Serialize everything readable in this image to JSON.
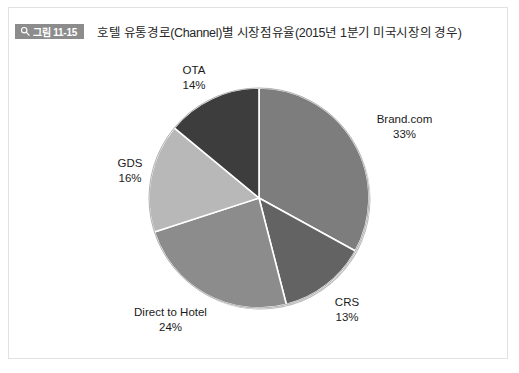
{
  "figure": {
    "badge_label": "그림 11-15",
    "badge_icon": "magnifier-icon",
    "badge_color": "#8c8c8c",
    "title": "호텔 유통경로(Channel)별 시장점유율(2015년 1분기 미국시장의 경우)",
    "panel_border_color": "#e2e2e2",
    "background_color": "#ffffff"
  },
  "chart_data": {
    "type": "pie",
    "title": "호텔 유통경로(Channel)별 시장점유율(2015년 1분기 미국시장의 경우)",
    "categories": [
      "Brand.com",
      "CRS",
      "Direct to Hotel",
      "GDS",
      "OTA"
    ],
    "values": [
      33,
      13,
      24,
      16,
      14
    ],
    "unit": "%",
    "start_angle_deg": 0,
    "direction": "clockwise",
    "legend": "none",
    "labels_position": "outside",
    "slices": [
      {
        "name": "Brand.com",
        "value": 33,
        "value_label": "33%",
        "color": "#7d7d7d"
      },
      {
        "name": "CRS",
        "value": 13,
        "value_label": "13%",
        "color": "#636363"
      },
      {
        "name": "Direct to Hotel",
        "value": 24,
        "value_label": "24%",
        "color": "#8c8c8c"
      },
      {
        "name": "GDS",
        "value": 16,
        "value_label": "16%",
        "color": "#b8b8b8"
      },
      {
        "name": "OTA",
        "value": 14,
        "value_label": "14%",
        "color": "#3d3d3d"
      }
    ],
    "slice_separator_color": "#ffffff",
    "outline_color": "#9a9a9a"
  }
}
